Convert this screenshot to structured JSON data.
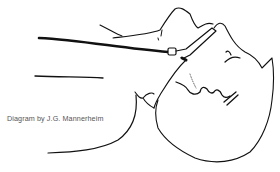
{
  "figure": {
    "caption": "Diagram by J.G. Mannerheim",
    "colors": {
      "ink": "#111111",
      "paper": "#ffffff",
      "caption": "#555555"
    }
  }
}
